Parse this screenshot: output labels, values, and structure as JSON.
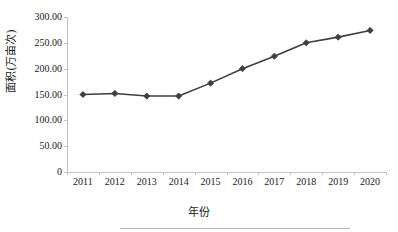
{
  "chart_data": {
    "type": "line",
    "title": "",
    "xlabel": "年份",
    "ylabel": "面积(万亩次)",
    "categories": [
      "2011",
      "2012",
      "2013",
      "2014",
      "2015",
      "2016",
      "2017",
      "2018",
      "2019",
      "2020"
    ],
    "values": [
      150.0,
      152.0,
      147.0,
      147.0,
      172.0,
      200.0,
      224.0,
      250.0,
      261.0,
      274.0
    ],
    "series": [
      {
        "name": "面积(万亩次)",
        "values": [
          150.0,
          152.0,
          147.0,
          147.0,
          172.0,
          200.0,
          224.0,
          250.0,
          261.0,
          274.0
        ]
      }
    ],
    "ylim": [
      0,
      300
    ],
    "y_ticks": [
      0,
      50,
      100,
      150,
      200,
      250,
      300
    ],
    "y_tick_labels": [
      "0",
      "50.00",
      "100.00",
      "150.00",
      "200.00",
      "250.00",
      "300.00"
    ],
    "x_tick_labels": [
      "2011",
      "2012",
      "2013",
      "2014",
      "2015",
      "2016",
      "2017",
      "2018",
      "2019",
      "2020"
    ],
    "grid": false,
    "legend": "none",
    "marker": "diamond",
    "line_color": "#3f3f3f",
    "marker_color": "#3f3f3f",
    "axis_color": "#c2c2c2",
    "background_color": "#ffffff"
  },
  "axes": {
    "y_title": "面积(万亩次)",
    "x_title": "年份"
  }
}
